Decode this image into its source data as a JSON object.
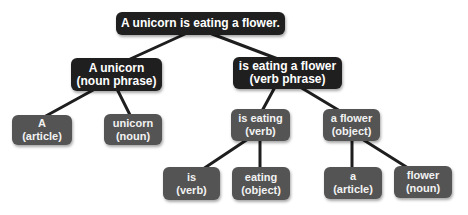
{
  "diagram": {
    "colors": {
      "root": "#1f1f1f",
      "phrase": "#1f1f1f",
      "leaf": "#545454",
      "line": "#1e1e1e"
    },
    "nodes": {
      "root": {
        "line1": "A unicorn is eating a flower.",
        "line2": ""
      },
      "noun_phrase": {
        "line1": "A unicorn",
        "line2": "(noun phrase)"
      },
      "verb_phrase": {
        "line1": "is eating a flower",
        "line2": "(verb phrase)"
      },
      "a_article": {
        "line1": "A",
        "line2": "(article)"
      },
      "unicorn_noun": {
        "line1": "unicorn",
        "line2": "(noun)"
      },
      "is_eating": {
        "line1": "is eating",
        "line2": "(verb)"
      },
      "a_flower": {
        "line1": "a flower",
        "line2": "(object)"
      },
      "is_verb": {
        "line1": "is",
        "line2": "(verb)"
      },
      "eating_object": {
        "line1": "eating",
        "line2": "(object)"
      },
      "a_article2": {
        "line1": "a",
        "line2": "(article)"
      },
      "flower_noun": {
        "line1": "flower",
        "line2": "(noun)"
      }
    },
    "edges": [
      [
        "root",
        "noun_phrase"
      ],
      [
        "root",
        "verb_phrase"
      ],
      [
        "noun_phrase",
        "a_article"
      ],
      [
        "noun_phrase",
        "unicorn_noun"
      ],
      [
        "verb_phrase",
        "is_eating"
      ],
      [
        "verb_phrase",
        "a_flower"
      ],
      [
        "is_eating",
        "is_verb"
      ],
      [
        "is_eating",
        "eating_object"
      ],
      [
        "a_flower",
        "a_article2"
      ],
      [
        "a_flower",
        "flower_noun"
      ]
    ]
  }
}
